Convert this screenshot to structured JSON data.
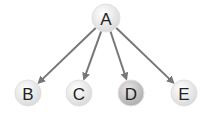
{
  "diagram": {
    "type": "tree",
    "root": {
      "id": "A",
      "label": "A",
      "x": 106,
      "y": 18,
      "r": 14,
      "fill": "#e2e2e2"
    },
    "children": [
      {
        "id": "B",
        "label": "B",
        "x": 28,
        "y": 93,
        "r": 13,
        "fill": "#f4f4f4"
      },
      {
        "id": "C",
        "label": "C",
        "x": 79,
        "y": 93,
        "r": 13,
        "fill": "#e6e6e6"
      },
      {
        "id": "D",
        "label": "D",
        "x": 131,
        "y": 93,
        "r": 13,
        "fill": "#c8c8c8"
      },
      {
        "id": "E",
        "label": "E",
        "x": 184,
        "y": 93,
        "r": 13,
        "fill": "#e6e6e6"
      }
    ],
    "edges": [
      {
        "from": "A",
        "to": "B"
      },
      {
        "from": "A",
        "to": "C"
      },
      {
        "from": "A",
        "to": "D"
      },
      {
        "from": "A",
        "to": "E"
      }
    ],
    "edge_color": "#777777"
  }
}
